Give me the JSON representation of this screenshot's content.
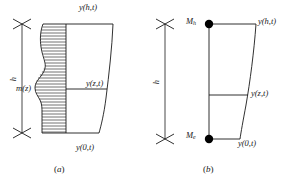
{
  "figure": {
    "title": "",
    "panels": [
      {
        "id": "a",
        "caption_open": "(",
        "caption_letter": "a",
        "caption_close": ")",
        "height_label": "h",
        "mass_label": "m(z)",
        "top_deflection_label": "y(h,t)",
        "mid_deflection_label": "y(z,t)",
        "base_deflection_label": "y(0,t)"
      },
      {
        "id": "b",
        "caption_open": "(",
        "caption_letter": "b",
        "caption_close": ")",
        "height_label": "h",
        "top_mass_label": "M",
        "top_mass_sub": "h",
        "bottom_mass_label": "M",
        "bottom_mass_sub": "e",
        "top_deflection_label": "y(h,t)",
        "mid_deflection_label": "y(z,t)",
        "base_deflection_label": "y(0,t)"
      }
    ],
    "colors": {
      "line": "#1a1a1a",
      "hatch": "#1a1a1a",
      "node": "#000000",
      "background": "#ffffff"
    }
  }
}
